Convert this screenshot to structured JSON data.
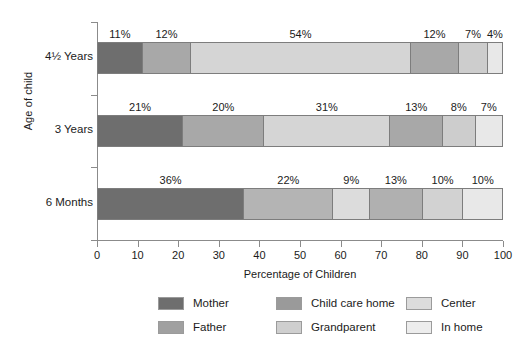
{
  "chart_data": {
    "type": "bar",
    "orientation": "horizontal",
    "stacked": true,
    "title": "",
    "xlabel": "Percentage of Children",
    "ylabel": "Age of child",
    "xlim": [
      0,
      100
    ],
    "xticks": [
      0,
      10,
      20,
      30,
      40,
      50,
      60,
      70,
      80,
      90,
      100
    ],
    "grid": false,
    "legend_position": "bottom",
    "value_suffix": "%",
    "categories": [
      "4½ Years",
      "3 Years",
      "6 Months"
    ],
    "series": [
      {
        "name": "Mother",
        "color": "#6e6e6e",
        "values": [
          11,
          21,
          36
        ]
      },
      {
        "name": "Father",
        "color": "#a8a8a8",
        "values": [
          12,
          20,
          22
        ]
      },
      {
        "name": "Child care home",
        "color": "#d5d5d5",
        "values": [
          54,
          31,
          9
        ]
      },
      {
        "name": "Grandparent",
        "color": "#a8a8a8",
        "values": [
          12,
          13,
          13
        ]
      },
      {
        "name": "Center",
        "color": "#cdcdcd",
        "values": [
          7,
          8,
          10
        ]
      },
      {
        "name": "In home",
        "color": "#e8e8e8",
        "values": [
          4,
          7,
          10
        ]
      }
    ],
    "bars": [
      {
        "category": "4½ Years",
        "segments": [
          {
            "series": "Mother",
            "value": 11,
            "label": "11%",
            "color": "#6e6e6e"
          },
          {
            "series": "Father",
            "value": 12,
            "label": "12%",
            "color": "#a8a8a8"
          },
          {
            "series": "Child care home",
            "value": 54,
            "label": "54%",
            "color": "#d5d5d5"
          },
          {
            "series": "Grandparent",
            "value": 12,
            "label": "12%",
            "color": "#a8a8a8"
          },
          {
            "series": "Center",
            "value": 7,
            "label": "7%",
            "color": "#cdcdcd"
          },
          {
            "series": "In home",
            "value": 4,
            "label": "4%",
            "color": "#e8e8e8"
          }
        ]
      },
      {
        "category": "3 Years",
        "segments": [
          {
            "series": "Mother",
            "value": 21,
            "label": "21%",
            "color": "#6e6e6e"
          },
          {
            "series": "Father",
            "value": 20,
            "label": "20%",
            "color": "#a8a8a8"
          },
          {
            "series": "Child care home",
            "value": 31,
            "label": "31%",
            "color": "#d5d5d5"
          },
          {
            "series": "Grandparent",
            "value": 13,
            "label": "13%",
            "color": "#a8a8a8"
          },
          {
            "series": "Center",
            "value": 8,
            "label": "8%",
            "color": "#cdcdcd"
          },
          {
            "series": "In home",
            "value": 7,
            "label": "7%",
            "color": "#e8e8e8"
          }
        ]
      },
      {
        "category": "6 Months",
        "segments": [
          {
            "series": "Mother",
            "value": 36,
            "label": "36%",
            "color": "#6e6e6e"
          },
          {
            "series": "Father",
            "value": 22,
            "label": "22%",
            "color": "#b4b4b4"
          },
          {
            "series": "Child care home",
            "value": 9,
            "label": "9%",
            "color": "#dcdcdc"
          },
          {
            "series": "Grandparent",
            "value": 13,
            "label": "13%",
            "color": "#b0b0b0"
          },
          {
            "series": "Center",
            "value": 10,
            "label": "10%",
            "color": "#d2d2d2"
          },
          {
            "series": "In home",
            "value": 10,
            "label": "10%",
            "color": "#e8e8e8"
          }
        ]
      }
    ],
    "legend": [
      {
        "label": "Mother",
        "color": "#6e6e6e"
      },
      {
        "label": "Child care home",
        "color": "#9a9a9a"
      },
      {
        "label": "Center",
        "color": "#dcdcdc"
      },
      {
        "label": "Father",
        "color": "#a0a0a0"
      },
      {
        "label": "Grandparent",
        "color": "#cfcfcf"
      },
      {
        "label": "In home",
        "color": "#ededed"
      }
    ]
  }
}
